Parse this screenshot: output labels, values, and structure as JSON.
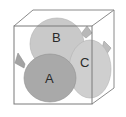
{
  "diagram": {
    "type": "balloons-in-box",
    "balloons": [
      {
        "label": "B",
        "fill": "#c9c9c9"
      },
      {
        "label": "C",
        "fill": "#cfcfcf"
      },
      {
        "label": "A",
        "fill": "#a9a9a9"
      }
    ],
    "box": {
      "stroke": "#7a7a7a"
    }
  }
}
